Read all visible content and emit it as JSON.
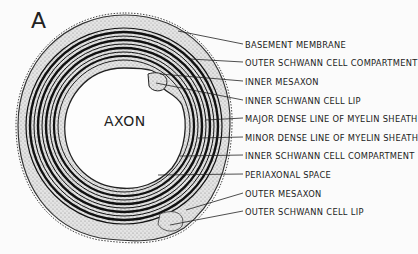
{
  "figure": {
    "panel_letter": "A",
    "center_label": "AXON"
  },
  "labels": [
    {
      "text": "BASEMENT MEMBRANE",
      "y": 40,
      "target": [
        178,
        31
      ]
    },
    {
      "text": "OUTER SCHWANN CELL COMPARTMENT",
      "y": 58,
      "target": [
        190,
        59
      ]
    },
    {
      "text": "INNER MESAXON",
      "y": 77,
      "target": [
        160,
        74
      ]
    },
    {
      "text": "INNER SCHWANN CELL LIP",
      "y": 96,
      "target": [
        156,
        83
      ]
    },
    {
      "text": "MAJOR DENSE LINE OF MYELIN SHEATH",
      "y": 114,
      "target": [
        206,
        120
      ]
    },
    {
      "text": "MINOR DENSE LINE OF MYELIN SHEATH",
      "y": 133,
      "target": [
        198,
        138
      ]
    },
    {
      "text": "INNER SCHWANN CELL COMPARTMENT",
      "y": 151,
      "target": [
        180,
        156
      ]
    },
    {
      "text": "PERIAXONAL SPACE",
      "y": 170,
      "target": [
        158,
        175
      ]
    },
    {
      "text": "OUTER MESAXON",
      "y": 189,
      "target": [
        186,
        210
      ]
    },
    {
      "text": "OUTER SCHWANN CELL LIP",
      "y": 207,
      "target": [
        170,
        225
      ]
    }
  ]
}
